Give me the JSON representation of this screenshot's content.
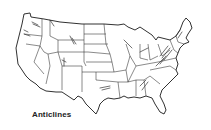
{
  "map": {
    "subject": "Contiguous United States",
    "style": "line-art state outline map",
    "label": "Anticlines",
    "feature_icon": "anticline-stroke-icon",
    "colors": {
      "background": "#ffffff",
      "lines": "#1a1a1a",
      "label": "#222222"
    }
  }
}
